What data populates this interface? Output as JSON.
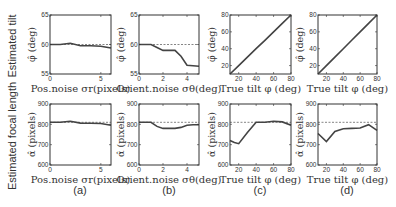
{
  "row_labels": [
    "Estimated tilt",
    "Estimated focal length"
  ],
  "panel_letters": [
    "(a)",
    "(b)",
    "(c)",
    "(d)"
  ],
  "chart_data": [
    {
      "type": "line",
      "panel": "a-top",
      "title": "",
      "xlabel": "Pos.noise σr(pixels)",
      "ylabel": "φ̂ (deg)",
      "xlim": [
        0,
        6
      ],
      "ylim": [
        55,
        65
      ],
      "xticks": [
        0,
        5
      ],
      "yticks": [
        55,
        60,
        65
      ],
      "reference": 60,
      "series": [
        {
          "name": "estimate",
          "x": [
            0,
            1,
            2,
            3,
            4,
            5,
            6
          ],
          "values": [
            60,
            60,
            60.2,
            59.8,
            59.8,
            59.7,
            59.4
          ]
        }
      ]
    },
    {
      "type": "line",
      "panel": "b-top",
      "title": "",
      "xlabel": "Orient.noise σθ(deg)",
      "ylabel": "φ̂ (deg)",
      "xlim": [
        0,
        5
      ],
      "ylim": [
        55,
        65
      ],
      "xticks": [
        0,
        2,
        4
      ],
      "yticks": [
        55,
        60,
        65
      ],
      "reference": 60,
      "series": [
        {
          "name": "estimate",
          "x": [
            0,
            1,
            1.5,
            2,
            2.5,
            3,
            3.5,
            4,
            4.5,
            5
          ],
          "values": [
            60,
            60,
            59.5,
            59,
            59,
            59,
            58,
            56.5,
            56.4,
            56.3
          ]
        }
      ]
    },
    {
      "type": "line",
      "panel": "c-top",
      "title": "",
      "xlabel": "True tilt φ (deg)",
      "ylabel": "φ̂ (deg)",
      "xlim": [
        10,
        80
      ],
      "ylim": [
        10,
        80
      ],
      "xticks": [
        20,
        40,
        60,
        80
      ],
      "yticks": [
        20,
        40,
        60,
        80
      ],
      "reference_diagonal": true,
      "series": [
        {
          "name": "estimate",
          "x": [
            10,
            20,
            30,
            40,
            50,
            60,
            70,
            80
          ],
          "values": [
            10,
            20,
            30,
            40,
            50,
            60,
            70,
            80
          ]
        }
      ]
    },
    {
      "type": "line",
      "panel": "d-top",
      "title": "",
      "xlabel": "True tilt φ (deg)",
      "ylabel": "φ̂ (deg)",
      "xlim": [
        10,
        80
      ],
      "ylim": [
        10,
        80
      ],
      "xticks": [
        20,
        40,
        60,
        80
      ],
      "yticks": [
        20,
        40,
        60,
        80
      ],
      "reference_diagonal": true,
      "series": [
        {
          "name": "estimate",
          "x": [
            10,
            20,
            30,
            40,
            50,
            60,
            70,
            80
          ],
          "values": [
            10,
            20,
            30,
            40,
            50,
            60,
            70,
            80
          ]
        }
      ]
    },
    {
      "type": "line",
      "panel": "a-bottom",
      "title": "",
      "xlabel": "Pos.noise σr(pixels)",
      "ylabel": "α̂ (pixels)",
      "xlim": [
        0,
        6
      ],
      "ylim": [
        600,
        900
      ],
      "xticks": [
        0,
        5
      ],
      "yticks": [
        600,
        700,
        800,
        900
      ],
      "reference": 810,
      "series": [
        {
          "name": "estimate",
          "x": [
            0,
            1,
            2,
            3,
            4,
            5,
            6
          ],
          "values": [
            810,
            810,
            815,
            806,
            805,
            804,
            795
          ]
        }
      ]
    },
    {
      "type": "line",
      "panel": "b-bottom",
      "title": "",
      "xlabel": "Orient.noise σθ(deg)",
      "ylabel": "α̂ (pixels)",
      "xlim": [
        0,
        5
      ],
      "ylim": [
        600,
        900
      ],
      "xticks": [
        0,
        2,
        4
      ],
      "yticks": [
        600,
        700,
        800,
        900
      ],
      "reference": 810,
      "series": [
        {
          "name": "estimate",
          "x": [
            0,
            1,
            1.5,
            2,
            2.5,
            3,
            3.5,
            4,
            4.5,
            5
          ],
          "values": [
            810,
            810,
            790,
            780,
            780,
            780,
            785,
            795,
            798,
            798
          ]
        }
      ]
    },
    {
      "type": "line",
      "panel": "c-bottom",
      "title": "",
      "xlabel": "True tilt φ (deg)",
      "ylabel": "α̂ (pixels)",
      "xlim": [
        10,
        80
      ],
      "ylim": [
        600,
        900
      ],
      "xticks": [
        20,
        40,
        60,
        80
      ],
      "yticks": [
        600,
        700,
        800,
        900
      ],
      "reference": 810,
      "series": [
        {
          "name": "estimate",
          "x": [
            10,
            15,
            20,
            30,
            40,
            50,
            60,
            70,
            80
          ],
          "values": [
            720,
            710,
            705,
            760,
            810,
            810,
            815,
            812,
            795
          ]
        }
      ]
    },
    {
      "type": "line",
      "panel": "d-bottom",
      "title": "",
      "xlabel": "True tilt φ (deg)",
      "ylabel": "α̂ (pixels)",
      "xlim": [
        10,
        80
      ],
      "ylim": [
        600,
        900
      ],
      "xticks": [
        20,
        40,
        60,
        80
      ],
      "yticks": [
        600,
        700,
        800,
        900
      ],
      "reference": 810,
      "series": [
        {
          "name": "estimate",
          "x": [
            10,
            20,
            30,
            40,
            50,
            60,
            70,
            80
          ],
          "values": [
            755,
            715,
            765,
            778,
            780,
            782,
            798,
            770
          ]
        }
      ]
    }
  ],
  "colors": {
    "line": "#444444",
    "reference": "#666666",
    "axes": "#333333"
  }
}
